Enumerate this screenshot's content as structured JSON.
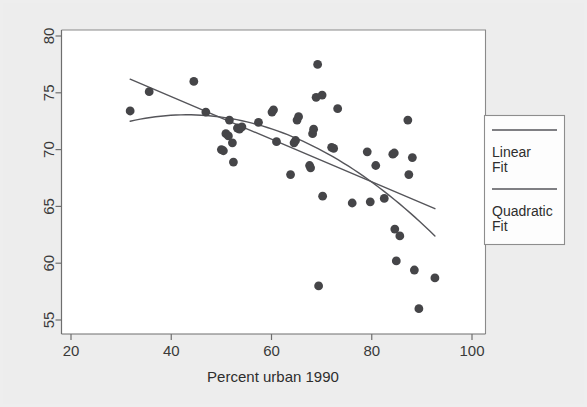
{
  "chart_data": {
    "type": "scatter",
    "title": "",
    "xlabel": "Percent urban 1990",
    "ylabel": "",
    "xlim": [
      20,
      100
    ],
    "ylim": [
      55,
      80
    ],
    "xticks": [
      20,
      40,
      60,
      80,
      100
    ],
    "yticks": [
      55,
      60,
      65,
      70,
      75,
      80
    ],
    "xtick_labels": [
      "20",
      "40",
      "60",
      "80",
      "100"
    ],
    "ytick_labels": [
      "55",
      "60",
      "65",
      "70",
      "75",
      "80"
    ],
    "grid": false,
    "y_axis_label_rotation": "vertical",
    "marker_color": "#454548",
    "line_color": "#55555a",
    "plot_background": "#ffffff",
    "page_background": "#ededed",
    "points": [
      {
        "x": 31.8,
        "y": 73.4
      },
      {
        "x": 35.6,
        "y": 75.1
      },
      {
        "x": 44.5,
        "y": 76.0
      },
      {
        "x": 46.9,
        "y": 73.3
      },
      {
        "x": 50.0,
        "y": 70.0
      },
      {
        "x": 50.4,
        "y": 69.9
      },
      {
        "x": 50.9,
        "y": 71.4
      },
      {
        "x": 51.4,
        "y": 71.2
      },
      {
        "x": 51.6,
        "y": 72.6
      },
      {
        "x": 52.2,
        "y": 70.6
      },
      {
        "x": 52.4,
        "y": 68.9
      },
      {
        "x": 53.2,
        "y": 71.9
      },
      {
        "x": 53.6,
        "y": 71.8
      },
      {
        "x": 54.1,
        "y": 72.0
      },
      {
        "x": 57.4,
        "y": 72.4
      },
      {
        "x": 60.1,
        "y": 73.3
      },
      {
        "x": 60.4,
        "y": 73.5
      },
      {
        "x": 61.0,
        "y": 70.7
      },
      {
        "x": 63.8,
        "y": 67.8
      },
      {
        "x": 64.5,
        "y": 70.6
      },
      {
        "x": 64.8,
        "y": 70.8
      },
      {
        "x": 65.1,
        "y": 72.6
      },
      {
        "x": 65.4,
        "y": 72.9
      },
      {
        "x": 67.6,
        "y": 68.6
      },
      {
        "x": 67.8,
        "y": 68.4
      },
      {
        "x": 68.2,
        "y": 71.4
      },
      {
        "x": 68.4,
        "y": 71.8
      },
      {
        "x": 68.9,
        "y": 74.6
      },
      {
        "x": 69.2,
        "y": 77.5
      },
      {
        "x": 69.4,
        "y": 58.0
      },
      {
        "x": 70.1,
        "y": 74.8
      },
      {
        "x": 70.2,
        "y": 65.9
      },
      {
        "x": 72.0,
        "y": 70.2
      },
      {
        "x": 72.4,
        "y": 70.1
      },
      {
        "x": 73.2,
        "y": 73.6
      },
      {
        "x": 76.1,
        "y": 65.3
      },
      {
        "x": 79.1,
        "y": 69.8
      },
      {
        "x": 79.7,
        "y": 65.4
      },
      {
        "x": 80.8,
        "y": 68.6
      },
      {
        "x": 82.5,
        "y": 65.7
      },
      {
        "x": 84.2,
        "y": 69.6
      },
      {
        "x": 84.5,
        "y": 69.7
      },
      {
        "x": 84.6,
        "y": 63.0
      },
      {
        "x": 84.9,
        "y": 60.2
      },
      {
        "x": 85.6,
        "y": 62.4
      },
      {
        "x": 87.2,
        "y": 72.6
      },
      {
        "x": 87.4,
        "y": 67.8
      },
      {
        "x": 88.1,
        "y": 69.3
      },
      {
        "x": 88.5,
        "y": 59.4
      },
      {
        "x": 89.4,
        "y": 56.0
      },
      {
        "x": 92.6,
        "y": 58.7
      }
    ],
    "fits": [
      {
        "name": "Linear Fit",
        "type": "linear",
        "x_start": 31.8,
        "x_end": 92.6,
        "y_start": 76.2,
        "y_end": 64.8
      },
      {
        "name": "Quadratic Fit",
        "type": "quadratic",
        "x_start": 31.8,
        "x_end": 92.6,
        "y_start": 72.5,
        "y_vertex_x": 47.0,
        "y_vertex": 73.0,
        "y_end": 62.4
      }
    ],
    "legend": {
      "position": "right",
      "entries": [
        {
          "label_line1": "Linear",
          "label_line2": "Fit"
        },
        {
          "label_line1": "Quadratic",
          "label_line2": "Fit"
        }
      ]
    }
  }
}
